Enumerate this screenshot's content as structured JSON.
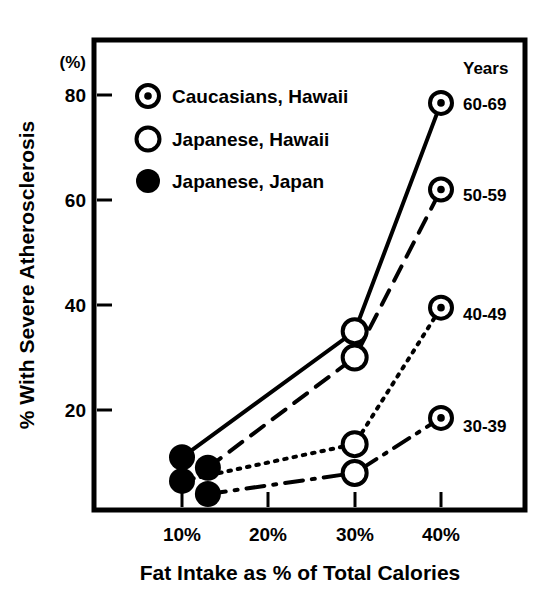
{
  "chart_data": {
    "type": "line",
    "title": "",
    "xlabel": "Fat Intake as % of Total Calories",
    "ylabel": "% With Severe Atherosclerosis",
    "y_unit_label": "(%)",
    "xlim": [
      5,
      45
    ],
    "ylim": [
      0,
      88
    ],
    "xticks": [
      "10%",
      "20%",
      "30%",
      "40%"
    ],
    "xtick_values": [
      10,
      20,
      30,
      40
    ],
    "yticks": [
      "20",
      "40",
      "60",
      "80"
    ],
    "ytick_values": [
      20,
      40,
      60,
      80
    ],
    "grid": false,
    "legend_position": "upper-left-inside",
    "series_legend_title": "Years",
    "legend": [
      {
        "key": "caucasians_hawaii",
        "label": "Caucasians, Hawaii",
        "marker": "bullseye"
      },
      {
        "key": "japanese_hawaii",
        "label": "Japanese, Hawaii",
        "marker": "open-circle"
      },
      {
        "key": "japanese_japan",
        "label": "Japanese, Japan",
        "marker": "filled-circle"
      }
    ],
    "series": [
      {
        "name": "60-69",
        "label": "60-69",
        "linestyle": "solid",
        "points": [
          {
            "x": 10,
            "y": 11,
            "marker": "filled-circle",
            "group": "Japanese, Japan"
          },
          {
            "x": 30,
            "y": 35,
            "marker": "open-circle",
            "group": "Japanese, Hawaii"
          },
          {
            "x": 40,
            "y": 78.5,
            "marker": "bullseye",
            "group": "Caucasians, Hawaii"
          }
        ]
      },
      {
        "name": "50-59",
        "label": "50-59",
        "linestyle": "dashed",
        "points": [
          {
            "x": 13,
            "y": 9,
            "marker": "filled-circle",
            "group": "Japanese, Japan"
          },
          {
            "x": 30,
            "y": 30,
            "marker": "open-circle",
            "group": "Japanese, Hawaii"
          },
          {
            "x": 40,
            "y": 62,
            "marker": "bullseye",
            "group": "Caucasians, Hawaii"
          }
        ]
      },
      {
        "name": "40-49",
        "label": "40-49",
        "linestyle": "dotted",
        "points": [
          {
            "x": 10,
            "y": 6.5,
            "marker": "filled-circle",
            "group": "Japanese, Japan"
          },
          {
            "x": 30,
            "y": 13.5,
            "marker": "open-circle",
            "group": "Japanese, Hawaii"
          },
          {
            "x": 40,
            "y": 39.5,
            "marker": "bullseye",
            "group": "Caucasians, Hawaii"
          }
        ]
      },
      {
        "name": "30-39",
        "label": "30-39",
        "linestyle": "dashdot",
        "points": [
          {
            "x": 13,
            "y": 4,
            "marker": "filled-circle",
            "group": "Japanese, Japan"
          },
          {
            "x": 30,
            "y": 8,
            "marker": "open-circle",
            "group": "Japanese, Hawaii"
          },
          {
            "x": 40,
            "y": 18.5,
            "marker": "bullseye",
            "group": "Caucasians, Hawaii"
          }
        ]
      }
    ],
    "colors": {
      "ink": "#000000",
      "background": "#ffffff"
    }
  },
  "axis": {
    "y_unit": "(%)",
    "y_title": "% With Severe Atherosclerosis",
    "x_title": "Fat Intake as % of Total Calories",
    "ytick_0": "80",
    "ytick_1": "60",
    "ytick_2": "40",
    "ytick_3": "20",
    "xtick_0": "10%",
    "xtick_1": "20%",
    "xtick_2": "30%",
    "xtick_3": "40%"
  },
  "legend": {
    "item_0": "Caucasians, Hawaii",
    "item_1": "Japanese, Hawaii",
    "item_2": "Japanese, Japan"
  },
  "series_labels": {
    "header": "Years",
    "l0": "60-69",
    "l1": "50-59",
    "l2": "40-49",
    "l3": "30-39"
  }
}
